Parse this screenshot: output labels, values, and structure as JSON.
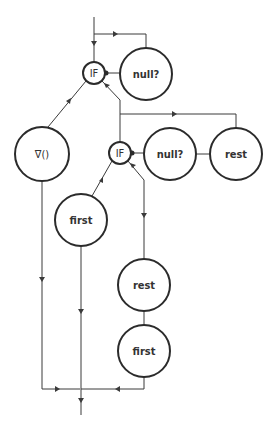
{
  "diagram": {
    "type": "dataflow-graph",
    "colors": {
      "stroke": "#2b2b2b",
      "background": "#ffffff",
      "text": "#333333"
    },
    "nodes": [
      {
        "id": "if1",
        "label": "IF",
        "cx": 94,
        "cy": 73,
        "r": 11
      },
      {
        "id": "null1",
        "label": "null?",
        "cx": 146,
        "cy": 74,
        "r": 26
      },
      {
        "id": "nabla",
        "label": "∇()",
        "cx": 42,
        "cy": 154,
        "r": 27
      },
      {
        "id": "if2",
        "label": "IF",
        "cx": 120,
        "cy": 153,
        "r": 11
      },
      {
        "id": "null2",
        "label": "null?",
        "cx": 170,
        "cy": 154,
        "r": 26
      },
      {
        "id": "rest1",
        "label": "rest",
        "cx": 236,
        "cy": 154,
        "r": 26
      },
      {
        "id": "first1",
        "label": "first",
        "cx": 81,
        "cy": 220,
        "r": 26
      },
      {
        "id": "rest2",
        "label": "rest",
        "cx": 144,
        "cy": 285,
        "r": 26
      },
      {
        "id": "first2",
        "label": "first",
        "cx": 144,
        "cy": 351,
        "r": 26
      }
    ],
    "edges": [
      {
        "from": "input",
        "to": "if1"
      },
      {
        "from": "input",
        "to": "null1"
      },
      {
        "from": "null1",
        "to": "if1"
      },
      {
        "from": "if1",
        "to": "nabla"
      },
      {
        "from": "if1",
        "to": "if2"
      },
      {
        "from": "if2",
        "to": "rest1"
      },
      {
        "from": "rest1",
        "to": "null2"
      },
      {
        "from": "null2",
        "to": "if2"
      },
      {
        "from": "if2",
        "to": "first1"
      },
      {
        "from": "if2",
        "to": "rest2"
      },
      {
        "from": "rest2",
        "to": "first2"
      },
      {
        "from": "nabla",
        "to": "output"
      },
      {
        "from": "first1",
        "to": "output"
      },
      {
        "from": "first2",
        "to": "output"
      }
    ]
  }
}
